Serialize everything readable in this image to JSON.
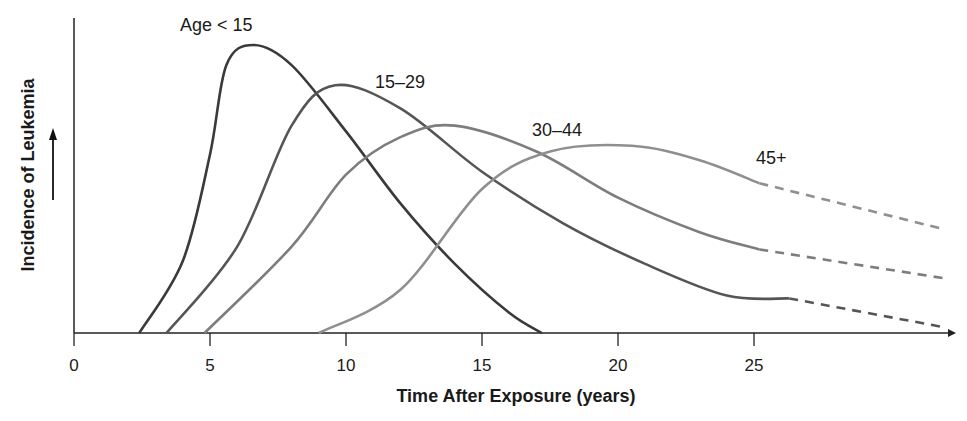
{
  "chart_data": {
    "type": "line",
    "title": "",
    "xlabel": "Time After Exposure (years)",
    "ylabel": "Incidence of Leukemia",
    "ylabel_arrow": "up-arrow",
    "xticks": [
      "0",
      "5",
      "10",
      "15",
      "20",
      "25"
    ],
    "xlim": [
      0,
      32
    ],
    "ylim": [
      0,
      1
    ],
    "y_axis_numeric": false,
    "grid": false,
    "legend": "inline labels",
    "series": [
      {
        "name": "Age < 15",
        "label": "Age < 15",
        "color": "#3a3a3a",
        "x": [
          2.4,
          4,
          5,
          5.6,
          6.6,
          8,
          10,
          12,
          14,
          16,
          17.2
        ],
        "y": [
          0,
          0.25,
          0.62,
          0.93,
          1.0,
          0.93,
          0.7,
          0.45,
          0.24,
          0.07,
          0
        ],
        "dashed_from": null
      },
      {
        "name": "15-29",
        "label": "15–29",
        "color": "#555555",
        "x": [
          3.4,
          6,
          8,
          9.6,
          12,
          15,
          18,
          21,
          24,
          26.3,
          32
        ],
        "y": [
          0,
          0.3,
          0.72,
          0.86,
          0.78,
          0.56,
          0.38,
          0.24,
          0.13,
          0.12,
          0.02
        ],
        "dashed_from": 26.3
      },
      {
        "name": "30-44",
        "label": "30–44",
        "color": "#7d7d7d",
        "x": [
          4.8,
          8,
          10,
          12,
          14,
          17,
          20,
          23,
          25.2,
          32
        ],
        "y": [
          0,
          0.3,
          0.55,
          0.68,
          0.72,
          0.63,
          0.47,
          0.35,
          0.29,
          0.19
        ],
        "dashed_from": 25.2
      },
      {
        "name": "45+",
        "label": "45+",
        "color": "#8f8f8f",
        "x": [
          9,
          12,
          15,
          17.5,
          20.5,
          23,
          25.2,
          32
        ],
        "y": [
          0,
          0.15,
          0.5,
          0.63,
          0.65,
          0.6,
          0.52,
          0.36
        ],
        "dashed_from": 25.2
      }
    ]
  }
}
